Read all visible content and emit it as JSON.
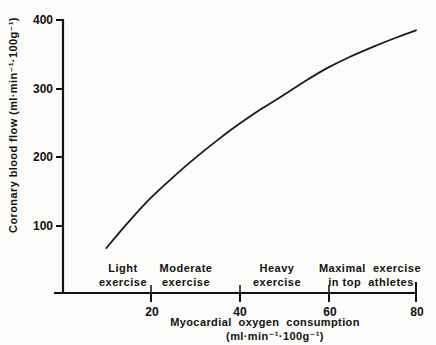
{
  "chart_data": {
    "type": "line",
    "title": "",
    "xlabel": "Myocardial oxygen consumption",
    "xlabel_units": "(ml·min⁻¹·100g⁻¹)",
    "ylabel": "Coronary blood flow (ml·min⁻¹·100g⁻¹)",
    "xlim": [
      0,
      80
    ],
    "ylim": [
      0,
      400
    ],
    "x_ticks": [
      20,
      40,
      60,
      80
    ],
    "y_ticks": [
      100,
      200,
      300,
      400
    ],
    "grid": false,
    "legend": null,
    "series": [
      {
        "name": "Coronary blood flow",
        "x": [
          10,
          15,
          20,
          25,
          30,
          35,
          40,
          45,
          50,
          55,
          60,
          65,
          70,
          75,
          80
        ],
        "values": [
          67,
          105,
          140,
          170,
          198,
          224,
          248,
          270,
          290,
          311,
          330,
          346,
          360,
          373,
          385
        ]
      }
    ],
    "annotations": [
      {
        "lines": [
          "Light",
          "exercise"
        ],
        "x": 10
      },
      {
        "lines": [
          "Moderate",
          "exercise"
        ],
        "x": 27
      },
      {
        "lines": [
          "Heavy",
          "exercise"
        ],
        "x": 48
      },
      {
        "lines": [
          "Maximal  exercise",
          "in top  athletes"
        ],
        "x": 70
      }
    ]
  },
  "labels": {
    "y_title": "Coronary blood flow (ml·min⁻¹·100g⁻¹)",
    "x_title_1": "Myocardial  oxygen  consumption",
    "x_title_2": "(ml·min⁻¹·100g⁻¹)",
    "ytick_400": "400",
    "ytick_300": "300",
    "ytick_200": "200",
    "ytick_100": "100",
    "xtick_20": "20",
    "xtick_40": "40",
    "xtick_60": "60",
    "xtick_80": "80",
    "zone_light_1": "Light",
    "zone_light_2": "exercise",
    "zone_moderate_1": "Moderate",
    "zone_moderate_2": "exercise",
    "zone_heavy_1": "Heavy",
    "zone_heavy_2": "exercise",
    "zone_max_1": "Maximal  exercise",
    "zone_max_2": "in top  athletes"
  }
}
